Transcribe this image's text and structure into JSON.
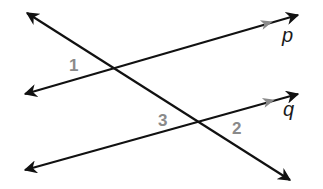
{
  "diagram": {
    "colors": {
      "line": "#111111",
      "direction_arrow": "#8a8a8a",
      "angle_label": "#8a8a8a",
      "line_label": "#1a1a1a",
      "background": "#ffffff"
    },
    "lines": {
      "p": {
        "label": "p",
        "x1": 25,
        "y1": 94,
        "x2": 298,
        "y2": 15,
        "parallel_marker": {
          "x": 268,
          "y": 23
        }
      },
      "q": {
        "label": "q",
        "x1": 25,
        "y1": 170,
        "x2": 298,
        "y2": 94,
        "parallel_marker": {
          "x": 270,
          "y": 101
        }
      },
      "transversal": {
        "x1": 27,
        "y1": 13,
        "x2": 290,
        "y2": 180
      }
    },
    "angles": [
      {
        "label": "1",
        "x": 71,
        "y": 71
      },
      {
        "label": "3",
        "x": 159,
        "y": 126
      },
      {
        "label": "2",
        "x": 233,
        "y": 134
      }
    ],
    "line_labels": {
      "p": {
        "text": "p",
        "x": 283,
        "y": 42
      },
      "q": {
        "text": "q",
        "x": 284,
        "y": 119
      }
    }
  }
}
